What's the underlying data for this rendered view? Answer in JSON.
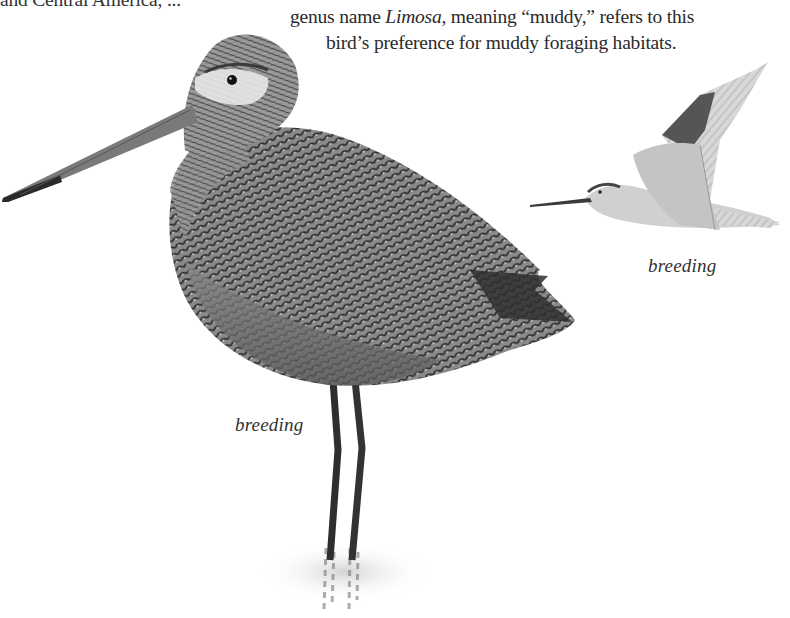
{
  "article": {
    "line_top": "and Central America, ...",
    "line_1_pre": "genus name ",
    "line_1_italic": "Limosa",
    "line_1_post": ", meaning “muddy,” refers to this",
    "line_2": "bird’s preference for muddy foraging habitats."
  },
  "illustrations": {
    "standing_bird": {
      "caption": "breeding",
      "icon": "standing-godwit-illustration"
    },
    "flying_bird": {
      "caption": "breeding",
      "icon": "flying-godwit-illustration"
    }
  },
  "colors": {
    "text": "#2a2a2a",
    "plumage_dark": "#3a3a3a",
    "plumage_mid": "#7a7a7a",
    "plumage_light": "#c8c8c8",
    "background": "#ffffff"
  }
}
